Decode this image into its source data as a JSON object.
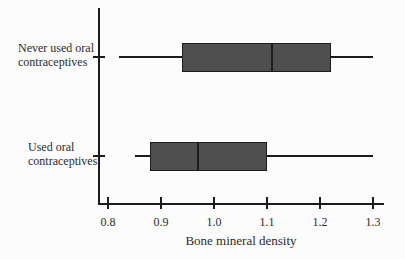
{
  "figure": {
    "background": "#fcfcfc"
  },
  "chart_data": {
    "type": "boxplot",
    "orientation": "horizontal",
    "title": "",
    "xlabel": "Bone mineral density",
    "ylabel": "",
    "xlim": [
      0.78,
      1.32
    ],
    "xticks": [
      0.8,
      0.9,
      1.0,
      1.1,
      1.2,
      1.3
    ],
    "grid": false,
    "legend": "none",
    "categories": [
      "Never used oral\ncontraceptives",
      "Used oral\ncontraceptives"
    ],
    "series": [
      {
        "name": "Never used oral contraceptives",
        "min": 0.82,
        "q1": 0.94,
        "median": 1.11,
        "q3": 1.22,
        "max": 1.3
      },
      {
        "name": "Used oral contraceptives",
        "min": 0.85,
        "q1": 0.88,
        "median": 0.97,
        "q3": 1.1,
        "max": 1.3
      }
    ],
    "colors": {
      "box_fill": "#4f4f4f",
      "line": "#1c1c1c",
      "text": "#2b2b2b",
      "background": "#fcfcfc"
    }
  }
}
